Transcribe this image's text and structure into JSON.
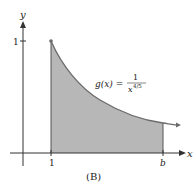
{
  "figure": {
    "caption": "(B)",
    "function_label": {
      "lhs": "g(x) =",
      "numerator": "1",
      "denominator_base": "x",
      "denominator_exponent": "4/5"
    },
    "axes": {
      "x_label": "x",
      "y_label": "y",
      "x_ticks": [
        "1",
        "b"
      ],
      "y_ticks": [
        "1"
      ]
    },
    "colors": {
      "shade": "#b7b7b7",
      "curve": "#6b6b6b",
      "axis": "#333333",
      "text": "#222222"
    }
  }
}
